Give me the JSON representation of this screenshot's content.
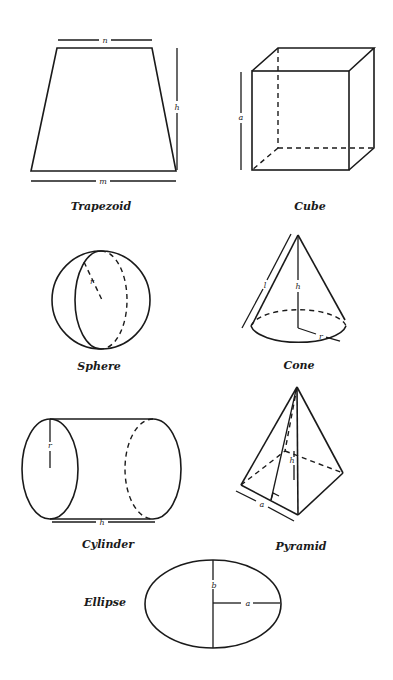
{
  "figure": {
    "shapes": [
      {
        "id": "trapezoid",
        "caption": "Trapezoid",
        "variables": [
          "n",
          "h",
          "m"
        ]
      },
      {
        "id": "cube",
        "caption": "Cube",
        "variables": [
          "a"
        ]
      },
      {
        "id": "sphere",
        "caption": "Sphere",
        "variables": [
          "r"
        ]
      },
      {
        "id": "cone",
        "caption": "Cone",
        "variables": [
          "l",
          "h",
          "r"
        ]
      },
      {
        "id": "cylinder",
        "caption": "Cylinder",
        "variables": [
          "r",
          "h"
        ]
      },
      {
        "id": "pyramid",
        "caption": "Pyramid",
        "variables": [
          "h",
          "a"
        ]
      },
      {
        "id": "ellipse",
        "caption": "Ellipse",
        "variables": [
          "b",
          "a"
        ]
      }
    ]
  },
  "colors": {
    "ink": "#1a1a1a",
    "background": "#ffffff"
  }
}
